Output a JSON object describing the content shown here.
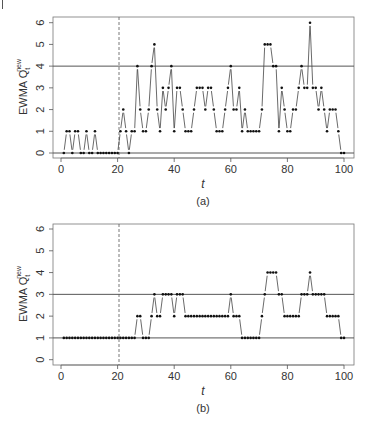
{
  "chart_data": [
    {
      "type": "line",
      "panel_label": "(a)",
      "title": "",
      "xlabel": "t",
      "ylabel": "EWMA Q",
      "ylabel_sub": "t",
      "ylabel_sup": "new",
      "xlim": [
        0,
        100
      ],
      "ylim": [
        0,
        6
      ],
      "xticks": [
        0,
        20,
        40,
        60,
        80,
        100
      ],
      "yticks": [
        0,
        1,
        2,
        3,
        4,
        5,
        6
      ],
      "grid": false,
      "legend": null,
      "reference_lines": {
        "horizontal": [
          0,
          4
        ],
        "vertical_dashed": [
          20.5
        ]
      },
      "series": [
        {
          "name": "EWMA Q_t^new",
          "style": "points connected by broken lines (type='b')",
          "x": [
            1,
            2,
            3,
            4,
            5,
            6,
            7,
            8,
            9,
            10,
            11,
            12,
            13,
            14,
            15,
            16,
            17,
            18,
            19,
            20,
            21,
            22,
            23,
            24,
            25,
            26,
            27,
            28,
            29,
            30,
            31,
            32,
            33,
            34,
            35,
            36,
            37,
            38,
            39,
            40,
            41,
            42,
            43,
            44,
            45,
            46,
            47,
            48,
            49,
            50,
            51,
            52,
            53,
            54,
            55,
            56,
            57,
            58,
            59,
            60,
            61,
            62,
            63,
            64,
            65,
            66,
            67,
            68,
            69,
            70,
            71,
            72,
            73,
            74,
            75,
            76,
            77,
            78,
            79,
            80,
            81,
            82,
            83,
            84,
            85,
            86,
            87,
            88,
            89,
            90,
            91,
            92,
            93,
            94,
            95,
            96,
            97,
            98,
            99,
            100
          ],
          "values": [
            0,
            1,
            1,
            0,
            1,
            1,
            0,
            0,
            1,
            0,
            0,
            1,
            0,
            0,
            0,
            0,
            0,
            0,
            0,
            0,
            1,
            2,
            1,
            0,
            1,
            1,
            4,
            2,
            1,
            1,
            2,
            4,
            5,
            2,
            1,
            3,
            2,
            3,
            4,
            1,
            3,
            3,
            2,
            1,
            1,
            1,
            2,
            3,
            3,
            3,
            2,
            3,
            3,
            2,
            1,
            1,
            1,
            2,
            3,
            4,
            2,
            2,
            3,
            1,
            2,
            1,
            1,
            1,
            1,
            1,
            2,
            5,
            5,
            5,
            4,
            4,
            1,
            3,
            2,
            1,
            1,
            2,
            2,
            3,
            4,
            3,
            3,
            6,
            3,
            3,
            2,
            3,
            2,
            1,
            2,
            2,
            2,
            1,
            0,
            0
          ]
        }
      ]
    },
    {
      "type": "line",
      "panel_label": "(b)",
      "title": "",
      "xlabel": "t",
      "ylabel": "EWMA Q",
      "ylabel_sub": "t",
      "ylabel_sup": "new",
      "xlim": [
        0,
        100
      ],
      "ylim": [
        0,
        6
      ],
      "xticks": [
        0,
        20,
        40,
        60,
        80,
        100
      ],
      "yticks": [
        0,
        1,
        2,
        3,
        4,
        5,
        6
      ],
      "grid": false,
      "legend": null,
      "reference_lines": {
        "horizontal": [
          1,
          3
        ],
        "vertical_dashed": [
          20.5
        ]
      },
      "series": [
        {
          "name": "EWMA Q_t^new",
          "style": "points connected by broken lines (type='b')",
          "x": [
            1,
            2,
            3,
            4,
            5,
            6,
            7,
            8,
            9,
            10,
            11,
            12,
            13,
            14,
            15,
            16,
            17,
            18,
            19,
            20,
            21,
            22,
            23,
            24,
            25,
            26,
            27,
            28,
            29,
            30,
            31,
            32,
            33,
            34,
            35,
            36,
            37,
            38,
            39,
            40,
            41,
            42,
            43,
            44,
            45,
            46,
            47,
            48,
            49,
            50,
            51,
            52,
            53,
            54,
            55,
            56,
            57,
            58,
            59,
            60,
            61,
            62,
            63,
            64,
            65,
            66,
            67,
            68,
            69,
            70,
            71,
            72,
            73,
            74,
            75,
            76,
            77,
            78,
            79,
            80,
            81,
            82,
            83,
            84,
            85,
            86,
            87,
            88,
            89,
            90,
            91,
            92,
            93,
            94,
            95,
            96,
            97,
            98,
            99,
            100
          ],
          "values": [
            1,
            1,
            1,
            1,
            1,
            1,
            1,
            1,
            1,
            1,
            1,
            1,
            1,
            1,
            1,
            1,
            1,
            1,
            1,
            1,
            1,
            1,
            1,
            1,
            1,
            1,
            2,
            2,
            1,
            1,
            1,
            2,
            3,
            2,
            2,
            3,
            3,
            3,
            3,
            2,
            3,
            3,
            3,
            2,
            2,
            2,
            2,
            2,
            2,
            2,
            2,
            2,
            2,
            2,
            2,
            2,
            2,
            2,
            2,
            3,
            2,
            2,
            2,
            1,
            1,
            1,
            1,
            1,
            1,
            1,
            2,
            3,
            4,
            4,
            4,
            4,
            3,
            3,
            2,
            2,
            2,
            2,
            2,
            2,
            3,
            3,
            3,
            4,
            3,
            3,
            3,
            3,
            3,
            2,
            2,
            2,
            2,
            2,
            1,
            1
          ]
        }
      ]
    }
  ],
  "panels": [
    {
      "ylabel": "EWMA Q",
      "ylabel_sub": "t",
      "ylabel_sup": "new",
      "xlabel": "t",
      "caption": "(a)",
      "xtick_labels": [
        "0",
        "20",
        "40",
        "60",
        "80",
        "100"
      ],
      "ytick_labels": [
        "0",
        "1",
        "2",
        "3",
        "4",
        "5",
        "6"
      ]
    },
    {
      "ylabel": "EWMA Q",
      "ylabel_sub": "t",
      "ylabel_sup": "new",
      "xlabel": "t",
      "caption": "(b)",
      "xtick_labels": [
        "0",
        "20",
        "40",
        "60",
        "80",
        "100"
      ],
      "ytick_labels": [
        "0",
        "1",
        "2",
        "3",
        "4",
        "5",
        "6"
      ]
    }
  ],
  "colors": {
    "axis": "#555555",
    "points": "#111111",
    "lines": "#444444",
    "reference": "#555555",
    "text": "#333333"
  }
}
